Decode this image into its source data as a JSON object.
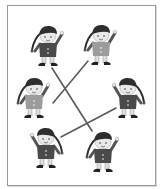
{
  "worksheet": {
    "type": "matching-pairs",
    "frame_color": "#9a9a9a",
    "line_color": "#5a5a5a",
    "colors": {
      "hat": "#2e2e2e",
      "skin": "#e9e9e9",
      "shirt_dark": "#4a4a4a",
      "shirt_light": "#9c9c9c",
      "pants_light": "#dedede",
      "shoe": "#222222"
    },
    "elves": [
      {
        "id": "elf-1",
        "x": 48,
        "y": 46,
        "shirt": "dark",
        "flip": false
      },
      {
        "id": "elf-2",
        "x": 101,
        "y": 45,
        "shirt": "light",
        "flip": false
      },
      {
        "id": "elf-3",
        "x": 34,
        "y": 98,
        "shirt": "light",
        "flip": false
      },
      {
        "id": "elf-4",
        "x": 128,
        "y": 98,
        "shirt": "dark",
        "flip": true
      },
      {
        "id": "elf-5",
        "x": 46,
        "y": 148,
        "shirt": "dark",
        "flip": true
      },
      {
        "id": "elf-6",
        "x": 103,
        "y": 152,
        "shirt": "dark",
        "flip": false
      }
    ],
    "connections": [
      {
        "from": "elf-1",
        "to": "elf-6",
        "x1": 52,
        "y1": 68,
        "x2": 92,
        "y2": 131
      },
      {
        "from": "elf-2",
        "to": "elf-3",
        "x1": 88,
        "y1": 61,
        "x2": 53,
        "y2": 103
      },
      {
        "from": "elf-4",
        "to": "elf-5",
        "x1": 116,
        "y1": 108,
        "x2": 61,
        "y2": 137
      }
    ]
  }
}
